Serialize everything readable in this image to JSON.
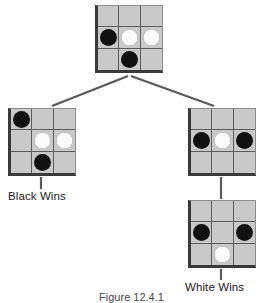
{
  "figure": {
    "caption": "Figure 12.4.1",
    "board_color": "#c9c9c9",
    "grid_line_color": "#5c5c5c",
    "board_edge_color": "#3a3a3a",
    "black_stone_color": "#111111",
    "white_stone_color": "#fbfbfb",
    "connector_color": "#5a5a5a"
  },
  "boards": [
    {
      "id": "root-board",
      "name": "root-position",
      "x": 95,
      "y": 5,
      "cells": [
        [
          "empty",
          "empty",
          "empty"
        ],
        [
          "black",
          "white",
          "white"
        ],
        [
          "empty",
          "black",
          "empty"
        ]
      ]
    },
    {
      "id": "left-board",
      "name": "left-child-position",
      "x": 8,
      "y": 108,
      "cells": [
        [
          "black",
          "empty",
          "empty"
        ],
        [
          "empty",
          "white",
          "white"
        ],
        [
          "empty",
          "black",
          "empty"
        ]
      ]
    },
    {
      "id": "right-upper-board",
      "name": "right-child-position",
      "x": 188,
      "y": 108,
      "cells": [
        [
          "empty",
          "empty",
          "empty"
        ],
        [
          "black",
          "white",
          "black"
        ],
        [
          "empty",
          "empty",
          "empty"
        ]
      ]
    },
    {
      "id": "right-lower-board",
      "name": "right-grandchild-position",
      "x": 188,
      "y": 200,
      "cells": [
        [
          "empty",
          "empty",
          "empty"
        ],
        [
          "black",
          "empty",
          "black"
        ],
        [
          "empty",
          "white",
          "empty"
        ]
      ]
    }
  ],
  "labels": [
    {
      "id": "black-wins-label",
      "text": "Black Wins",
      "x": 8,
      "y": 190
    },
    {
      "id": "white-wins-label",
      "text": "White Wins",
      "x": 185,
      "y": 281
    }
  ],
  "connectors": [
    {
      "id": "root-to-left",
      "from": "root-board",
      "to": "left-board",
      "x1": 128,
      "y1": 76,
      "x2": 52,
      "y2": 106
    },
    {
      "id": "root-to-right",
      "from": "root-board",
      "to": "right-upper-board",
      "x1": 131,
      "y1": 76,
      "x2": 214,
      "y2": 106
    },
    {
      "id": "left-to-label",
      "from": "left-board",
      "to": "black-wins-label",
      "x1": 41,
      "y1": 177,
      "x2": 41,
      "y2": 189
    },
    {
      "id": "right-upper-to-lower",
      "from": "right-upper-board",
      "to": "right-lower-board",
      "x1": 221,
      "y1": 177,
      "x2": 221,
      "y2": 199
    },
    {
      "id": "right-lower-to-label",
      "from": "right-lower-board",
      "to": "white-wins-label",
      "x1": 221,
      "y1": 269,
      "x2": 221,
      "y2": 280
    }
  ]
}
